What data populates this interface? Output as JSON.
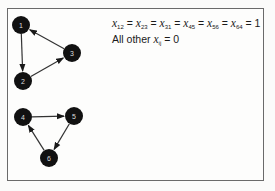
{
  "diagram": {
    "nodes": [
      {
        "id": "1",
        "label": "1",
        "x": 21,
        "y": 25
      },
      {
        "id": "2",
        "label": "2",
        "x": 23,
        "y": 81
      },
      {
        "id": "3",
        "label": "3",
        "x": 72,
        "y": 53
      },
      {
        "id": "4",
        "label": "4",
        "x": 23,
        "y": 117
      },
      {
        "id": "5",
        "label": "5",
        "x": 74,
        "y": 116
      },
      {
        "id": "6",
        "label": "6",
        "x": 49,
        "y": 158
      }
    ],
    "edges": [
      {
        "from": "1",
        "to": "2"
      },
      {
        "from": "2",
        "to": "3"
      },
      {
        "from": "3",
        "to": "1"
      },
      {
        "from": "4",
        "to": "5"
      },
      {
        "from": "5",
        "to": "6"
      },
      {
        "from": "6",
        "to": "4"
      }
    ]
  },
  "equation": {
    "line1": {
      "terms": [
        {
          "var": "x",
          "sub": "12"
        },
        {
          "var": "x",
          "sub": "23"
        },
        {
          "var": "x",
          "sub": "31"
        },
        {
          "var": "x",
          "sub": "45"
        },
        {
          "var": "x",
          "sub": "56"
        },
        {
          "var": "x",
          "sub": "64"
        }
      ],
      "eq": "=",
      "value": "1"
    },
    "line2": {
      "prefix": "All other",
      "var": "x",
      "sub": "ij",
      "eq": "=",
      "value": "0"
    }
  }
}
